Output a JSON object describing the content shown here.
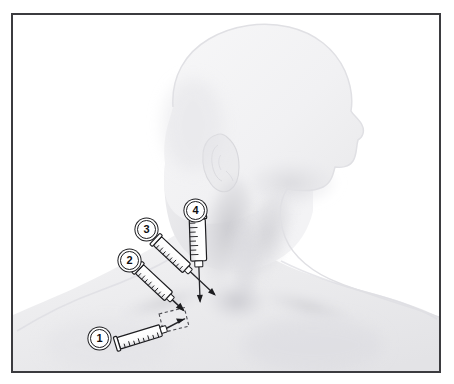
{
  "figure": {
    "domain": "medical-illustration",
    "background_color": "#ffffff",
    "frame": {
      "border_color": "#3b3b3f",
      "border_width_px": 2,
      "x": 11,
      "y": 13,
      "width": 430,
      "height": 360
    },
    "palette": {
      "skin_light": "#f4f4f5",
      "skin_mid": "#e6e6e8",
      "skin_shadow": "#d2d2d6",
      "skin_deep_shadow": "#c2c2c7",
      "outline": "#1d1d20",
      "syringe_body": "#ffffff",
      "needle": "#2a2a2e",
      "marker_text": "#101013",
      "dashed_target": "#4a4a50"
    }
  },
  "markers": [
    {
      "id": "marker-1",
      "label": "1",
      "x": 88,
      "y": 327,
      "approach": "infraclavicular / low anterior approach",
      "needle_direction": "upper-right",
      "target": "dashed-target-area"
    },
    {
      "id": "marker-2",
      "label": "2",
      "x": 118,
      "y": 249,
      "approach": "supraclavicular lateral approach",
      "needle_direction": "lower-right",
      "target": "dashed-target-area"
    },
    {
      "id": "marker-3",
      "label": "3",
      "x": 135,
      "y": 218,
      "approach": "posterior sternocleidomastoid approach",
      "needle_direction": "lower-right",
      "target": "internal jugular vein"
    },
    {
      "id": "marker-4",
      "label": "4",
      "x": 184,
      "y": 199,
      "approach": "central / anterior jugular approach",
      "needle_direction": "downward",
      "target": "internal jugular vein"
    }
  ],
  "syringes": [
    {
      "id": "syringe-1",
      "marker": "1",
      "barrel_start": {
        "x": 104,
        "y": 339
      },
      "barrel_end": {
        "x": 143,
        "y": 327
      },
      "needle_tip": {
        "x": 163,
        "y": 320
      },
      "angle_deg": -17,
      "graduation_marks": 8
    },
    {
      "id": "syringe-2",
      "marker": "2",
      "barrel_start": {
        "x": 129,
        "y": 262
      },
      "barrel_end": {
        "x": 157,
        "y": 288
      },
      "needle_tip": {
        "x": 170,
        "y": 303
      },
      "angle_deg": 43,
      "graduation_marks": 8
    },
    {
      "id": "syringe-3",
      "marker": "3",
      "barrel_start": {
        "x": 148,
        "y": 233
      },
      "barrel_end": {
        "x": 174,
        "y": 257
      },
      "needle_tip": {
        "x": 194,
        "y": 281
      },
      "angle_deg": 43,
      "graduation_marks": 8
    },
    {
      "id": "syringe-4",
      "marker": "4",
      "barrel_start": {
        "x": 194,
        "y": 218
      },
      "barrel_end": {
        "x": 194,
        "y": 258
      },
      "needle_tip": {
        "x": 197,
        "y": 289
      },
      "angle_deg": 90,
      "graduation_marks": 8
    }
  ],
  "target_area": {
    "id": "dashed-target-area",
    "shape": "rotated-rectangle",
    "center": {
      "x": 172,
      "y": 318
    },
    "width": 26,
    "height": 19,
    "rotation_deg": -14,
    "stroke": "dashed",
    "label": "injection target landmark"
  },
  "anatomy_labels": {
    "head": "head-profile-silhouette",
    "ear": "ear",
    "neck": "neck",
    "sternocleidomastoid": "sternocleidomastoid-muscle-shadow",
    "clavicle": "clavicle-shadow",
    "sternal_notch": "suprasternal-notch",
    "shoulder_left": "left-shoulder",
    "shoulder_right": "right-shoulder",
    "upper_chest": "upper-chest"
  }
}
